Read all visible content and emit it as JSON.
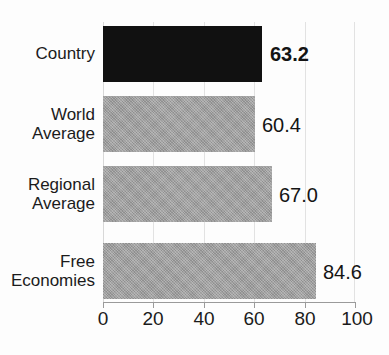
{
  "chart_data": {
    "type": "bar",
    "orientation": "horizontal",
    "title": "",
    "xlabel": "",
    "ylabel": "",
    "xlim": [
      0,
      100
    ],
    "xticks": [
      "0",
      "20",
      "40",
      "60",
      "80",
      "100"
    ],
    "grid": true,
    "legend": null,
    "categories": [
      "Country",
      "World Average",
      "Regional Average",
      "Free Economies"
    ],
    "values": [
      63.2,
      60.4,
      67.0,
      84.6
    ],
    "value_labels": [
      "63.2",
      "60.4",
      "67.0",
      "84.6"
    ],
    "bars": [
      {
        "category": "Country",
        "label_lines": [
          "Country"
        ],
        "value": 63.2,
        "value_label": "63.2",
        "color": "#111111",
        "color_name": "black",
        "emphasis": "bold"
      },
      {
        "category": "World Average",
        "label_lines": [
          "World",
          "Average"
        ],
        "value": 60.4,
        "value_label": "60.4",
        "color": "#9d9d9d",
        "color_name": "gray",
        "emphasis": "normal"
      },
      {
        "category": "Regional Average",
        "label_lines": [
          "Regional",
          "Average"
        ],
        "value": 67.0,
        "value_label": "67.0",
        "color": "#9d9d9d",
        "color_name": "gray",
        "emphasis": "normal"
      },
      {
        "category": "Free Economies",
        "label_lines": [
          "Free",
          "Economies"
        ],
        "value": 84.6,
        "value_label": "84.6",
        "color": "#9d9d9d",
        "color_name": "gray",
        "emphasis": "normal"
      }
    ]
  },
  "colors": {
    "highlight_bar": "#111111",
    "reference_bar": "#9d9d9d",
    "gridline": "#e2e2e2",
    "axis": "#9a9a9a",
    "text": "#1b1b1b",
    "background": "#fdfdfd"
  },
  "axis": {
    "ticks": [
      "0",
      "20",
      "40",
      "60",
      "80",
      "100"
    ],
    "min": 0,
    "max": 100,
    "step": 20
  },
  "labels": {
    "country": "Country",
    "world_line1": "World",
    "world_line2": "Average",
    "regional_line1": "Regional",
    "regional_line2": "Average",
    "free_line1": "Free",
    "free_line2": "Economies"
  },
  "values": {
    "country": "63.2",
    "world": "60.4",
    "regional": "67.0",
    "free": "84.6"
  },
  "title_remnant": ""
}
